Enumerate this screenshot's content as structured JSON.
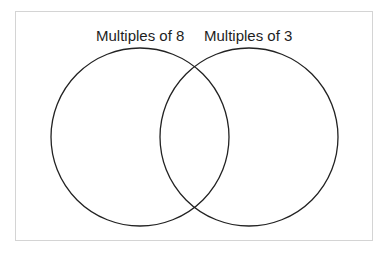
{
  "diagram": {
    "type": "venn",
    "sets": [
      {
        "id": "left",
        "label": "Multiples of 8",
        "members": []
      },
      {
        "id": "right",
        "label": "Multiples of 3",
        "members": []
      }
    ],
    "intersection": {
      "members": []
    },
    "colors": {
      "stroke": "#222222",
      "text": "#1e1e1e",
      "frame": "#d4d4d4",
      "background": "#ffffff"
    }
  }
}
